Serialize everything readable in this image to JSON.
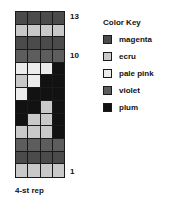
{
  "chart_data": {
    "type": "heatmap",
    "title": "",
    "subtitle": "",
    "xlabel": "",
    "ylabel": "",
    "columns": 4,
    "rows": 13,
    "grid_on": true,
    "legend_position": "right",
    "row_labels_visible": [
      "13",
      "10",
      "1"
    ],
    "row_label_rows": [
      13,
      10,
      1
    ],
    "palette": {
      "magenta": "#4b4b4b",
      "ecru": "#c9c9c9",
      "pale pink": "#ececec",
      "violet": "#5d5d5d",
      "plum": "#121212"
    },
    "legend_order": [
      "magenta",
      "ecru",
      "pale pink",
      "violet",
      "plum"
    ],
    "cells": [
      {
        "row": 13,
        "values": [
          "magenta",
          "magenta",
          "magenta",
          "magenta"
        ]
      },
      {
        "row": 12,
        "values": [
          "ecru",
          "ecru",
          "ecru",
          "ecru"
        ]
      },
      {
        "row": 11,
        "values": [
          "magenta",
          "magenta",
          "magenta",
          "magenta"
        ]
      },
      {
        "row": 10,
        "values": [
          "violet",
          "violet",
          "violet",
          "violet"
        ]
      },
      {
        "row": 9,
        "values": [
          "pale pink",
          "pale pink",
          "pale pink",
          "plum"
        ]
      },
      {
        "row": 8,
        "values": [
          "ecru",
          "pale pink",
          "plum",
          "plum"
        ]
      },
      {
        "row": 7,
        "values": [
          "pale pink",
          "plum",
          "plum",
          "plum"
        ]
      },
      {
        "row": 6,
        "values": [
          "plum",
          "plum",
          "ecru",
          "plum"
        ]
      },
      {
        "row": 5,
        "values": [
          "plum",
          "ecru",
          "ecru",
          "plum"
        ]
      },
      {
        "row": 4,
        "values": [
          "ecru",
          "ecru",
          "ecru",
          "plum"
        ]
      },
      {
        "row": 3,
        "values": [
          "violet",
          "violet",
          "violet",
          "violet"
        ]
      },
      {
        "row": 2,
        "values": [
          "magenta",
          "magenta",
          "magenta",
          "magenta"
        ]
      },
      {
        "row": 1,
        "values": [
          "ecru",
          "ecru",
          "ecru",
          "ecru"
        ]
      },
      {
        "row": 0,
        "values": [
          "violet",
          "violet",
          "violet",
          "violet"
        ]
      }
    ]
  },
  "chart": {
    "caption": "4-st rep",
    "row_labels": [
      {
        "text": "13",
        "row_index": 0
      },
      {
        "text": "10",
        "row_index": 3
      },
      {
        "text": "1",
        "row_index": 12
      }
    ]
  },
  "legend": {
    "title": "Color Key",
    "items": [
      {
        "label": "magenta",
        "color": "#4b4b4b"
      },
      {
        "label": "ecru",
        "color": "#c9c9c9"
      },
      {
        "label": "pale pink",
        "color": "#ececec"
      },
      {
        "label": "violet",
        "color": "#5d5d5d"
      },
      {
        "label": "plum",
        "color": "#121212"
      }
    ]
  }
}
